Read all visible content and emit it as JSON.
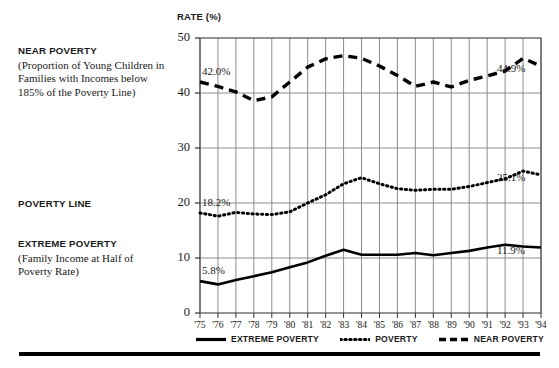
{
  "chart_data": {
    "type": "line",
    "title": "",
    "xlabel": "",
    "ylabel": "RATE (%)",
    "ylim": [
      0,
      50
    ],
    "yticks": [
      0,
      10,
      20,
      30,
      40,
      50
    ],
    "grid": true,
    "legend_position": "bottom",
    "x": [
      "'75",
      "'76",
      "'77",
      "'78",
      "'79",
      "'80",
      "'81",
      "'82",
      "'83",
      "'84",
      "'85",
      "'86",
      "'87",
      "'88",
      "'89",
      "'90",
      "'91",
      "'92",
      "'93",
      "'94"
    ],
    "series": [
      {
        "name": "EXTREME POVERTY",
        "style": "solid",
        "values": [
          5.8,
          5.2,
          6.0,
          6.7,
          7.4,
          8.3,
          9.2,
          10.4,
          11.5,
          10.6,
          10.6,
          10.6,
          10.9,
          10.5,
          10.9,
          11.3,
          11.9,
          12.4,
          12.1,
          11.9
        ]
      },
      {
        "name": "POVERTY",
        "style": "dotted",
        "values": [
          18.2,
          17.6,
          18.3,
          18.0,
          17.9,
          18.4,
          20.0,
          21.5,
          23.5,
          24.6,
          23.5,
          22.6,
          22.3,
          22.5,
          22.5,
          23.0,
          23.7,
          24.4,
          25.8,
          25.1
        ]
      },
      {
        "name": "NEAR POVERTY",
        "style": "dashed",
        "values": [
          42.0,
          41.2,
          40.2,
          38.6,
          39.3,
          42.0,
          44.7,
          46.2,
          46.8,
          46.3,
          44.9,
          43.2,
          41.2,
          42.0,
          41.1,
          42.3,
          43.1,
          44.0,
          46.3,
          44.9
        ]
      }
    ],
    "point_labels": [
      {
        "text": "42.0%",
        "series": "NEAR POVERTY",
        "x": "'75",
        "value": 42.0
      },
      {
        "text": "44.9%",
        "series": "NEAR POVERTY",
        "x": "'94",
        "value": 44.9
      },
      {
        "text": "18.2%",
        "series": "POVERTY",
        "x": "'75",
        "value": 18.2
      },
      {
        "text": "25.1%",
        "series": "POVERTY",
        "x": "'94",
        "value": 25.1
      },
      {
        "text": "5.8%",
        "series": "EXTREME POVERTY",
        "x": "'75",
        "value": 5.8
      },
      {
        "text": "11.9%",
        "series": "EXTREME POVERTY",
        "x": "'94",
        "value": 11.9
      }
    ]
  },
  "annotations": {
    "near_poverty": {
      "heading": "NEAR POVERTY",
      "detail": "(Proportion of Young Children in Families with Incomes below 185% of the Poverty Line)"
    },
    "poverty_line": {
      "heading": "POVERTY LINE",
      "detail": ""
    },
    "extreme_poverty": {
      "heading": "EXTREME POVERTY",
      "detail": "(Family Income at Half of Poverty Rate)"
    }
  },
  "legend": {
    "items": [
      {
        "label": "EXTREME POVERTY",
        "style": "solid",
        "color": "#000000"
      },
      {
        "label": "POVERTY",
        "style": "dotted",
        "color": "#000000"
      },
      {
        "label": "NEAR POVERTY",
        "style": "dashed",
        "color": "#000000"
      }
    ]
  },
  "colors": {
    "line": "#000000",
    "grid": "#808080",
    "axis": "#555555",
    "text": "#1a1a1a"
  },
  "caption": ""
}
